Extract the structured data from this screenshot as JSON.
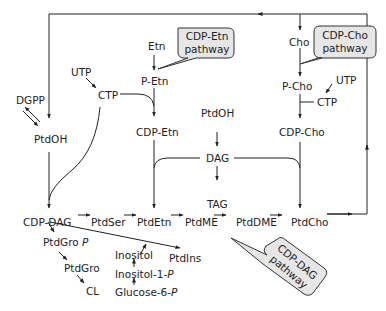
{
  "diagram": {
    "nodes": {
      "etn": "Etn",
      "p_etn": "P-Etn",
      "cdp_etn": "CDP-Etn",
      "cho": "Cho",
      "p_cho": "P-Cho",
      "cdp_cho": "CDP-Cho",
      "utp_left": "UTP",
      "ctp_left": "CTP",
      "utp_right": "UTP",
      "ctp_right": "CTP",
      "dgpp": "DGPP",
      "ptdoh_left": "PtdOH",
      "ptdoh_center": "PtdOH",
      "dag": "DAG",
      "tag": "TAG",
      "cdp_dag": "CDP-DAG",
      "ptdser": "PtdSer",
      "ptdetn": "PtdEtn",
      "ptdme": "PtdME",
      "ptddme": "PtdDME",
      "ptdcho": "PtdCho",
      "ptdgrop_main": "PtdGro",
      "ptdgrop_suffix": "P",
      "ptdgro": "PtdGro",
      "cl": "CL",
      "inositol": "Inositol",
      "inositol1p_main": "Inositol-1-",
      "inositol1p_suffix": "P",
      "glucose6p_main": "Glucose-6-",
      "glucose6p_suffix": "P",
      "ptdins": "PtdIns"
    },
    "callouts": {
      "cdp_etn_line1": "CDP-Etn",
      "cdp_etn_line2": "pathway",
      "cdp_cho_line1": "CDP-Cho",
      "cdp_cho_line2": "pathway",
      "cdp_dag_line1": "CDP-DAG",
      "cdp_dag_line2": "pathway"
    },
    "colors": {
      "line": "#222222",
      "bubble_fill": "#e6e6e6",
      "bubble_stroke": "#333333"
    }
  }
}
